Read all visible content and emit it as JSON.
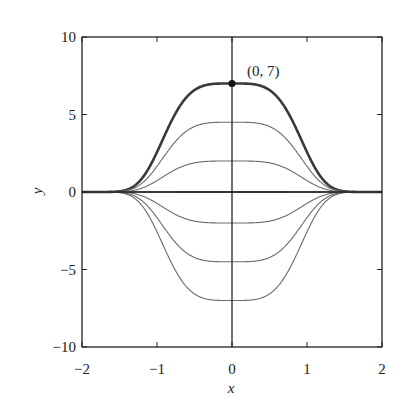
{
  "chart_data": {
    "type": "line",
    "title": "",
    "xlabel": "x",
    "ylabel": "y",
    "xlim": [
      -2,
      2
    ],
    "ylim": [
      -10,
      10
    ],
    "grid": false,
    "legend": null,
    "x_ticks": [
      -2,
      -1,
      0,
      1,
      2
    ],
    "y_ticks": [
      -10,
      -5,
      0,
      5,
      10
    ],
    "x_tick_labels": [
      "−2",
      "−1",
      "0",
      "1",
      "2"
    ],
    "y_tick_labels": [
      "−10",
      "−5",
      "0",
      "5",
      "10"
    ],
    "function_family": "y = C·e^(−x^4)",
    "series": [
      {
        "name": "C=7 (highlighted)",
        "C": 7,
        "bold": true
      },
      {
        "name": "C=4.5",
        "C": 4.5,
        "bold": false
      },
      {
        "name": "C=2",
        "C": 2,
        "bold": false
      },
      {
        "name": "C=0.03",
        "C": 0.03,
        "bold": false
      },
      {
        "name": "C=-0.03",
        "C": -0.03,
        "bold": false
      },
      {
        "name": "C=-2",
        "C": -2,
        "bold": false
      },
      {
        "name": "C=-4.5",
        "C": -4.5,
        "bold": false
      },
      {
        "name": "C=-7",
        "C": -7,
        "bold": false
      }
    ],
    "annotations": [
      {
        "text": "(0, 7)",
        "x": 0,
        "y": 7,
        "marker": "dot"
      }
    ],
    "colors": {
      "curve": "#6a6a6a",
      "highlight": "#3a3a3a",
      "axes": "#222222"
    }
  }
}
